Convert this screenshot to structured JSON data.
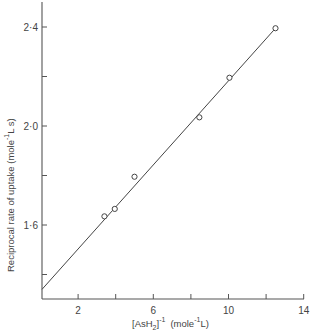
{
  "chart_data": {
    "type": "scatter",
    "title": "",
    "xlabel": "[AsH2]^-1 (mole^-1 L)",
    "ylabel": "Reciprocal rate of uptake (mole^-1 L s)",
    "xlim": [
      0,
      14
    ],
    "ylim": [
      1.3,
      2.5
    ],
    "grid": false,
    "legend": null,
    "x_ticks": [
      2,
      6,
      10,
      14
    ],
    "x_minor_ticks": [
      4,
      8,
      12
    ],
    "y_ticks": [
      1.6,
      2.0,
      2.4
    ],
    "y_minor_ticks": [
      1.4,
      1.8,
      2.2
    ],
    "x_tick_labels": [
      "2",
      "6",
      "10",
      "14"
    ],
    "y_tick_labels": [
      "1·6",
      "2·0",
      "2·4"
    ],
    "series": [
      {
        "name": "observed",
        "marker": "open-circle",
        "points": [
          {
            "x": 3.4,
            "y": 1.635
          },
          {
            "x": 3.95,
            "y": 1.665
          },
          {
            "x": 5.0,
            "y": 1.795
          },
          {
            "x": 8.45,
            "y": 2.035
          },
          {
            "x": 10.05,
            "y": 2.195
          },
          {
            "x": 12.5,
            "y": 2.395
          }
        ]
      },
      {
        "name": "linear fit",
        "type": "line",
        "points": [
          {
            "x": 0.0,
            "y": 1.34
          },
          {
            "x": 12.5,
            "y": 2.395
          }
        ]
      }
    ]
  },
  "labels": {
    "x_axis_main": "[AsH",
    "x_axis_sub": "2",
    "x_axis_close": "]",
    "x_axis_sup": "-1",
    "x_axis_units_pre": "(mole",
    "x_axis_units_sup": "-1",
    "x_axis_units_post": "L)",
    "y_axis_main": "Reciprocal  rate  of  uptake  (mole",
    "y_axis_sup": "-1",
    "y_axis_post": "L s)"
  }
}
